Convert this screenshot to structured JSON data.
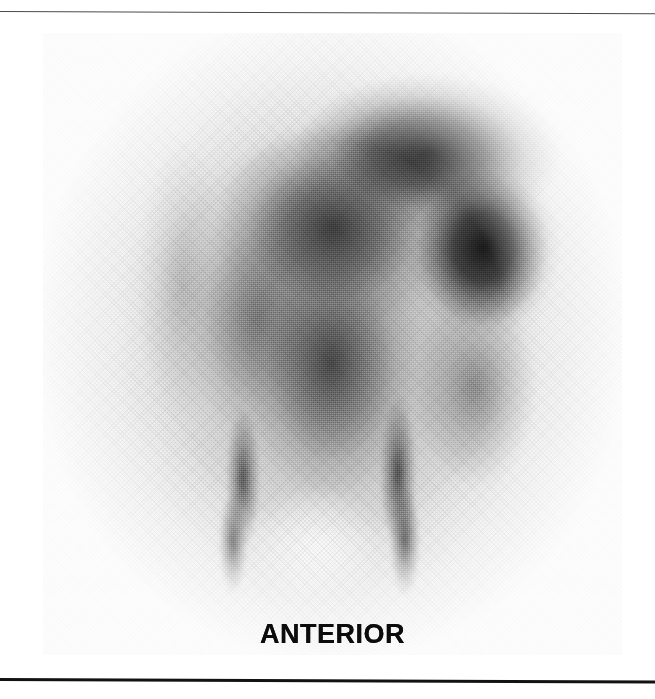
{
  "figure": {
    "type": "scintigram",
    "modality": "nuclear-medicine-planar-scintigraphy",
    "orientation_label": "ANTERIOR",
    "panel": {
      "background_color": "#ededee",
      "left": 43,
      "top": 33,
      "width": 579,
      "height": 622
    },
    "rules": {
      "top_color": "#4a4a4a",
      "bottom_color": "#121212"
    },
    "label_color": "#0c0c0c"
  },
  "chart_data": {
    "type": "heatmap",
    "title": "",
    "subtitle": "",
    "xlabel": "",
    "ylabel": "",
    "annotations": [
      "ANTERIOR"
    ],
    "legend": [],
    "grid": false,
    "colormap": "grayscale-inverted",
    "intensity_scale": {
      "min_label": "low uptake",
      "max_label": "high uptake",
      "min_value": 0,
      "max_value": 1
    },
    "regions": [
      {
        "name": "right-upper-quadrant-focus",
        "cx": 440,
        "cy": 215,
        "rx": 78,
        "ry": 92,
        "intensity": 0.93
      },
      {
        "name": "upper-right-contour-band",
        "cx": 385,
        "cy": 120,
        "rx": 135,
        "ry": 80,
        "intensity": 0.88
      },
      {
        "name": "central-upper-mass",
        "cx": 290,
        "cy": 195,
        "rx": 120,
        "ry": 105,
        "intensity": 0.8
      },
      {
        "name": "mid-central-column",
        "cx": 288,
        "cy": 330,
        "rx": 88,
        "ry": 135,
        "intensity": 0.74
      },
      {
        "name": "left-paramedian-uptake",
        "cx": 215,
        "cy": 285,
        "rx": 72,
        "ry": 120,
        "intensity": 0.55
      },
      {
        "name": "left-flank-rim",
        "cx": 140,
        "cy": 250,
        "rx": 46,
        "ry": 140,
        "intensity": 0.34
      },
      {
        "name": "right-lower-lateral",
        "cx": 432,
        "cy": 355,
        "rx": 62,
        "ry": 100,
        "intensity": 0.52
      },
      {
        "name": "left-vessel-stripe",
        "cx": 200,
        "cy": 445,
        "rx": 17,
        "ry": 72,
        "intensity": 0.78
      },
      {
        "name": "right-vessel-stripe",
        "cx": 355,
        "cy": 440,
        "rx": 18,
        "ry": 78,
        "intensity": 0.8
      },
      {
        "name": "left-iliac-tail",
        "cx": 190,
        "cy": 510,
        "rx": 14,
        "ry": 52,
        "intensity": 0.82
      },
      {
        "name": "right-iliac-tail",
        "cx": 362,
        "cy": 508,
        "rx": 15,
        "ry": 56,
        "intensity": 0.84
      },
      {
        "name": "central-pelvis-photopenic",
        "cx": 272,
        "cy": 512,
        "rx": 70,
        "ry": 58,
        "intensity": 0.05
      },
      {
        "name": "body-silhouette-halo",
        "cx": 288,
        "cy": 300,
        "rx": 215,
        "ry": 268,
        "intensity": 0.42
      }
    ]
  }
}
